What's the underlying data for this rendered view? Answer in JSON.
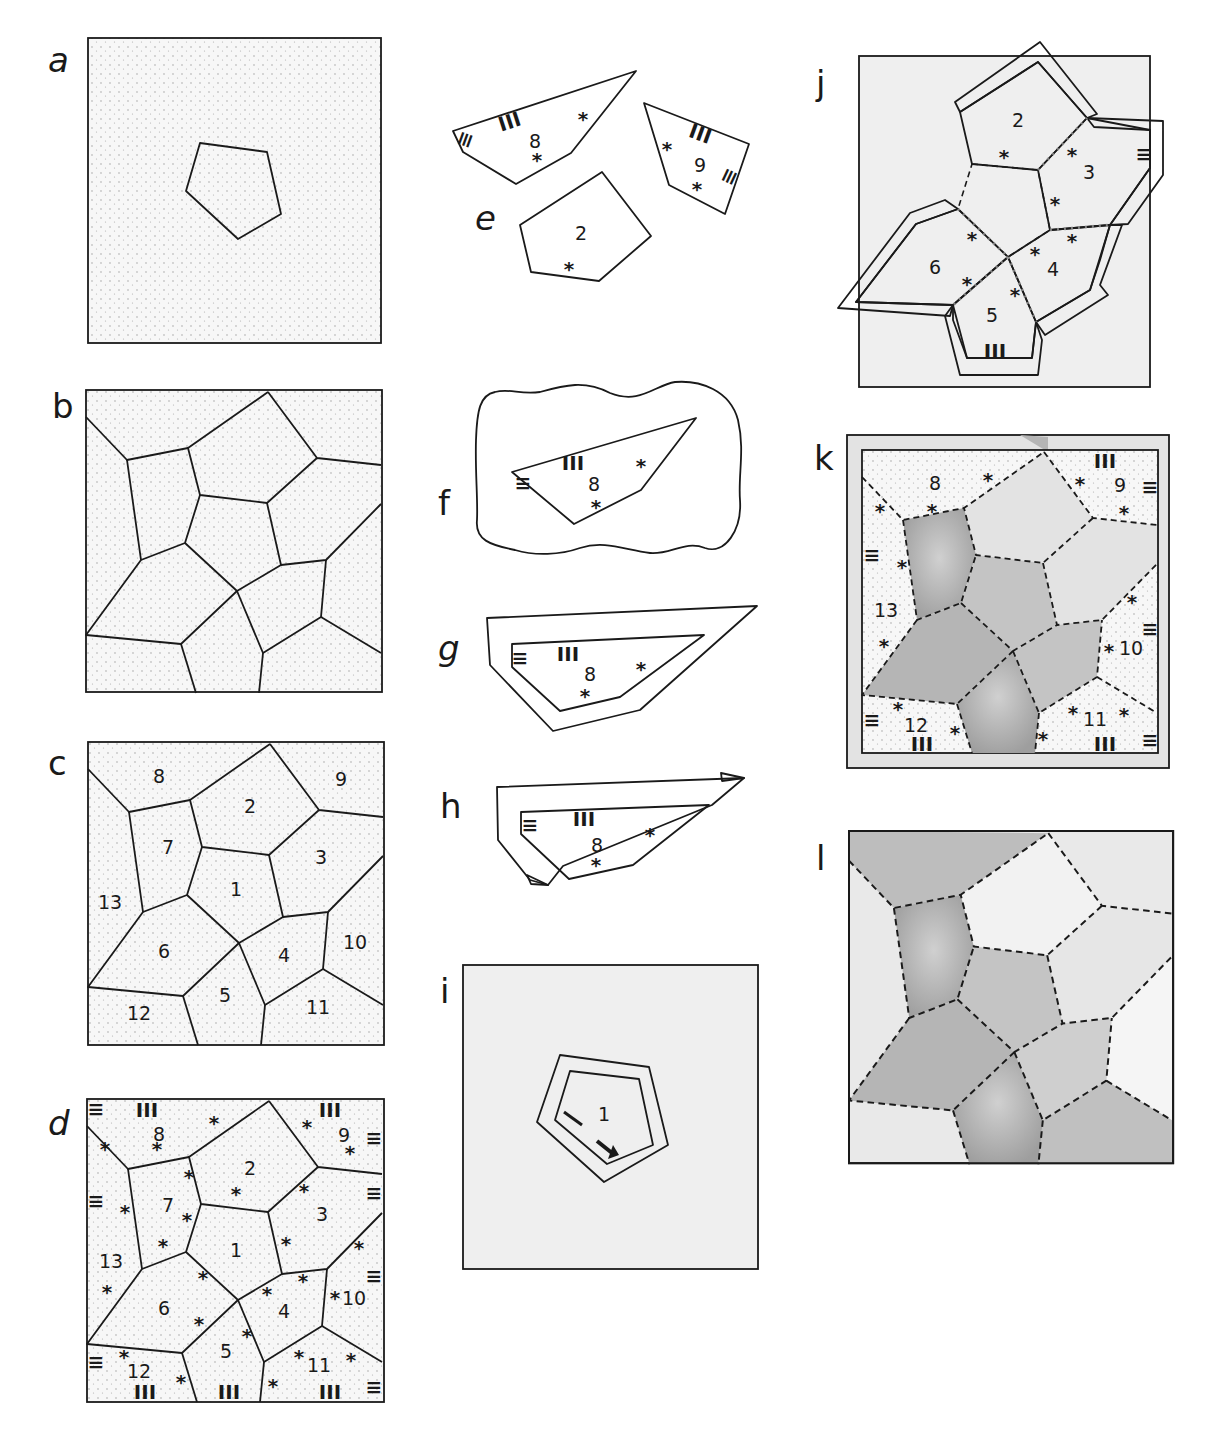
{
  "figure": {
    "panels": [
      {
        "id": "a",
        "label": "a",
        "description": "Single pentagon tile inside stippled square"
      },
      {
        "id": "b",
        "label": "b",
        "description": "Voronoi-like tessellation, unlabeled"
      },
      {
        "id": "c",
        "label": "c",
        "description": "Tessellation with numbered pieces 1-13"
      },
      {
        "id": "d",
        "label": "d",
        "description": "Numbered pieces with * and stripe markers"
      },
      {
        "id": "e",
        "label": "e",
        "description": "Cut-out pieces 8, 9 and 2"
      },
      {
        "id": "f",
        "label": "f",
        "description": "Piece 8 on grey blob background"
      },
      {
        "id": "g",
        "label": "g",
        "description": "Piece 8 with grey seam allowance"
      },
      {
        "id": "h",
        "label": "h",
        "description": "Piece 8 with folded seam allowance"
      },
      {
        "id": "i",
        "label": "i",
        "description": "Pentagon 1 with seam allowance and arrow"
      },
      {
        "id": "j",
        "label": "j",
        "description": "Pieces 2-6 arranged around central pentagon"
      },
      {
        "id": "k",
        "label": "k",
        "description": "Assembled tessellation with outer pieces 8-13"
      },
      {
        "id": "l",
        "label": "l",
        "description": "Finished tessellation with dashed stitching"
      }
    ],
    "piece_numbers": {
      "p1": "1",
      "p2": "2",
      "p3": "3",
      "p4": "4",
      "p5": "5",
      "p6": "6",
      "p7": "7",
      "p8": "8",
      "p9": "9",
      "p10": "10",
      "p11": "11",
      "p12": "12",
      "p13": "13"
    },
    "markers": {
      "star": "*",
      "stripes_v": "III",
      "stripes_h": "≡"
    },
    "colors": {
      "ink": "#1a1a1a",
      "paper": "#ffffff",
      "stipple_bg": "#f4f4f4",
      "light_grey": "#e8e8e8",
      "mid_grey": "#c4c4c4",
      "dark_grey": "#a9a9a9",
      "frame_bg": "#efefef"
    }
  }
}
